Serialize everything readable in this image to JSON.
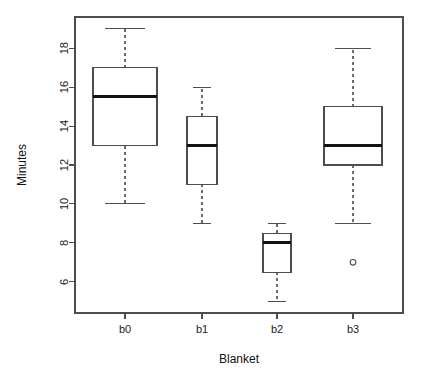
{
  "chart_data": {
    "type": "box",
    "title": "",
    "xlabel": "Blanket",
    "ylabel": "Minutes",
    "categories": [
      "b0",
      "b1",
      "b2",
      "b3"
    ],
    "ylim": [
      4.4,
      19.6
    ],
    "yticks": [
      6,
      8,
      10,
      12,
      14,
      16,
      18
    ],
    "ytick_labels": [
      "6",
      "8",
      "10",
      "12",
      "14",
      "16",
      "18"
    ],
    "grid": false,
    "legend": "none",
    "box_style": "variable-width",
    "boxes": [
      {
        "category": "b0",
        "min": 10,
        "q1": 13,
        "median": 15.5,
        "q3": 17,
        "max": 19,
        "outliers": [],
        "center_x": 125,
        "half_width": 32
      },
      {
        "category": "b1",
        "min": 9,
        "q1": 11,
        "median": 13,
        "q3": 14.5,
        "max": 16,
        "outliers": [],
        "center_x": 202,
        "half_width": 15
      },
      {
        "category": "b2",
        "min": 5,
        "q1": 6.5,
        "median": 8,
        "q3": 8.5,
        "max": 9,
        "outliers": [],
        "center_x": 277,
        "half_width": 14
      },
      {
        "category": "b3",
        "min": 9,
        "q1": 12,
        "median": 13,
        "q3": 15,
        "max": 18,
        "outliers": [
          7
        ],
        "center_x": 353,
        "half_width": 29
      }
    ]
  },
  "plot": {
    "frame": {
      "left": 75,
      "right": 403,
      "top": 17,
      "bottom": 313
    },
    "y_axis": {
      "label": "Minutes",
      "tick_x": 75,
      "tick_len": 6
    },
    "x_axis": {
      "label": "Blanket",
      "tick_y": 313,
      "tick_len": 6
    }
  },
  "colors": {
    "background": "#ffffff",
    "frame": "#4d4d4d",
    "box_stroke": "#4d4d4d",
    "box_fill": "#ffffff",
    "median": "#111111",
    "whisker": "#6b6b6b",
    "text": "#1a1a1a"
  }
}
